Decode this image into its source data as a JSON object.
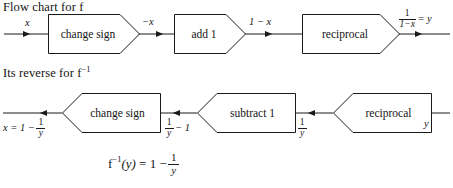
{
  "page": {
    "background_color": "#ffffff",
    "line_color": "#1a1a1a",
    "text_color": "#141414"
  },
  "forward": {
    "heading_text": "Flow chart for f",
    "heading_base": "Flow chart for f",
    "input_label": "x",
    "boxes": [
      {
        "label": "change sign",
        "direction": "right"
      },
      {
        "label": "add 1",
        "direction": "right"
      },
      {
        "label": "reciprocal",
        "direction": "right"
      }
    ],
    "edge_labels": [
      {
        "text": "−x"
      },
      {
        "text": "1 − x"
      }
    ],
    "output": {
      "numerator": "1",
      "denominator": "1−x",
      "equals": "= y"
    }
  },
  "reverse": {
    "heading_base": "Its reverse for f",
    "heading_sup": "−1",
    "output_label": {
      "lead": "x = 1 −",
      "numerator": "1",
      "denominator": "y"
    },
    "boxes": [
      {
        "label": "change sign",
        "direction": "left"
      },
      {
        "label": "subtract 1",
        "direction": "left"
      },
      {
        "label": "reciprocal",
        "direction": "left"
      }
    ],
    "edge_labels": [
      {
        "numerator": "1",
        "denominator": "y",
        "trail": "− 1"
      },
      {
        "numerator": "1",
        "denominator": "y",
        "trail": ""
      }
    ],
    "input_label": "y"
  },
  "formula": {
    "fn": "f",
    "fn_sup": "−1",
    "arg": "(y)",
    "equals": "= 1 −",
    "numerator": "1",
    "denominator": "y"
  }
}
